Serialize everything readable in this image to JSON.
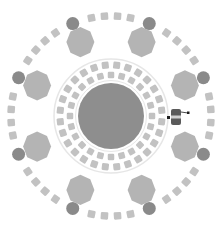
{
  "diagram": {
    "type": "circular-seating-layout",
    "canvas": {
      "width": 223,
      "height": 231
    },
    "center": {
      "x": 111,
      "y": 116
    },
    "colors": {
      "background": "#ffffff",
      "center_table": "#8e8e8e",
      "seat": "#c2c2c2",
      "octagon_table": "#b4b4b4",
      "pillar": "#8a8a8a",
      "ring_line": "#e6e6e6",
      "agent_body": "#5a5a5a",
      "agent_accent": "#1e1e1e"
    },
    "center_table": {
      "radius": 33
    },
    "inner_rings": [
      {
        "name": "inner-seat-ring-1",
        "radius": 41,
        "count": 24,
        "size": 6.5
      },
      {
        "name": "inner-seat-ring-2",
        "radius": 51,
        "count": 28,
        "size": 7
      }
    ],
    "divider_ring": {
      "radius": 57
    },
    "octagon_tables": {
      "radius": 80,
      "count": 8,
      "size": 26,
      "angle_offset_deg": 22.5
    },
    "outer_seat_ring": {
      "radius": 100,
      "count": 48,
      "size": 7.5
    },
    "pillars": {
      "radius": 100,
      "count": 8,
      "size": 13,
      "angle_offset_deg": 22.5
    },
    "agent": {
      "x": 176,
      "y": 117,
      "label": ""
    }
  }
}
